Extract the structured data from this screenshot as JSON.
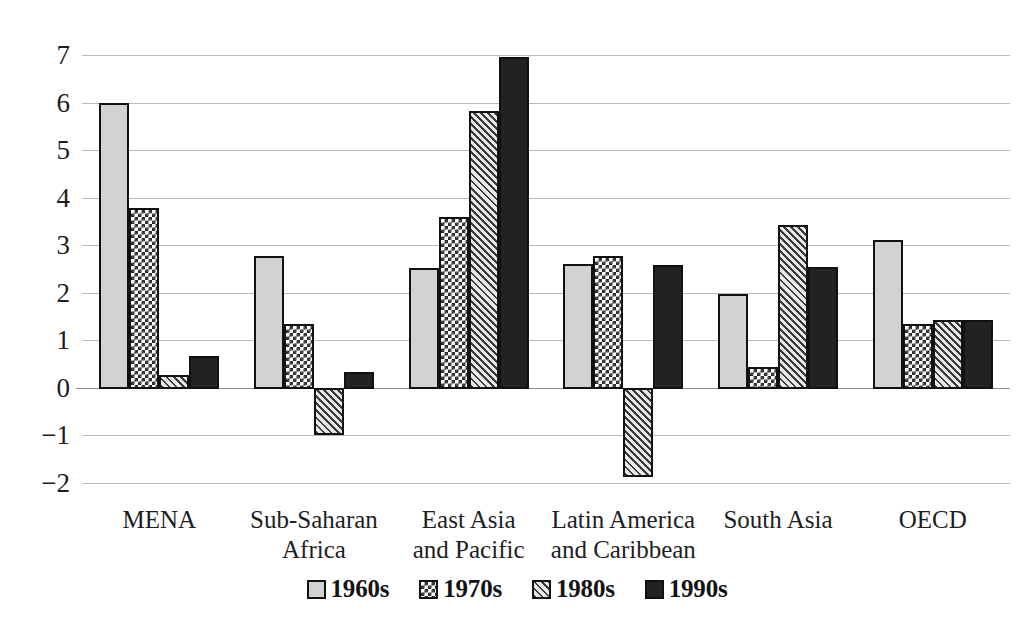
{
  "chart_data": {
    "type": "bar",
    "title": "",
    "subtitle": "",
    "xlabel": "",
    "ylabel": "",
    "ylim": [
      -2,
      7
    ],
    "yticks": [
      7,
      6,
      5,
      4,
      3,
      2,
      1,
      0,
      -1,
      -2
    ],
    "ytick_labels": [
      "7",
      "6",
      "5",
      "4",
      "3",
      "2",
      "1",
      "0",
      "−1",
      "−2"
    ],
    "grid": true,
    "legend_position": "bottom",
    "categories": [
      "MENA",
      "Sub-Saharan\nAfrica",
      "East Asia\nand Pacific",
      "Latin America\nand Caribbean",
      "South Asia",
      "OECD"
    ],
    "series": [
      {
        "name": "1960s",
        "pattern": "solid-light-gray",
        "color": "#d2d2d2",
        "values": [
          6.0,
          2.77,
          2.52,
          2.6,
          1.97,
          3.12
        ]
      },
      {
        "name": "1970s",
        "pattern": "checkerboard",
        "color": "#ffffff",
        "values": [
          3.78,
          1.35,
          3.6,
          2.78,
          0.43,
          1.35
        ]
      },
      {
        "name": "1980s",
        "pattern": "diagonal-hatch",
        "color": "#e0e0e0",
        "values": [
          0.27,
          -0.97,
          5.83,
          -1.85,
          3.43,
          1.43
        ]
      },
      {
        "name": "1990s",
        "pattern": "solid-black",
        "color": "#222222",
        "values": [
          0.68,
          0.33,
          6.95,
          2.58,
          2.55,
          1.42
        ]
      }
    ]
  },
  "legend": {
    "items": [
      {
        "label": "1960s"
      },
      {
        "label": "1970s"
      },
      {
        "label": "1980s"
      },
      {
        "label": "1990s"
      }
    ]
  }
}
